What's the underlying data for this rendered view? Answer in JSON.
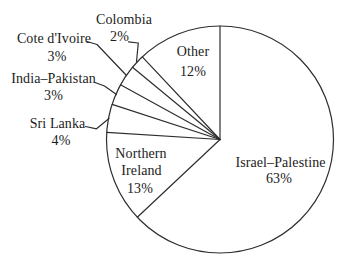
{
  "colors": {
    "background": "#ffffff",
    "line": "#2e2e2e",
    "text": "#1c1c1c"
  },
  "chart_data": {
    "type": "pie",
    "title": "",
    "direction": "clockwise",
    "start_angle_deg": 0,
    "legend": "none",
    "slices": [
      {
        "label": "Israel–Palestine",
        "value": 63,
        "pct_text": "63%",
        "label_position": "inside"
      },
      {
        "label": "Northern Ireland",
        "value": 13,
        "pct_text": "13%",
        "label_position": "inside",
        "label_lines": [
          "Northern",
          "Ireland"
        ]
      },
      {
        "label": "Sri Lanka",
        "value": 4,
        "pct_text": "4%",
        "label_position": "outside-left"
      },
      {
        "label": "India–Pakistan",
        "value": 3,
        "pct_text": "3%",
        "label_position": "outside-left"
      },
      {
        "label": "Cote d'Ivoire",
        "value": 3,
        "pct_text": "3%",
        "label_position": "outside-left"
      },
      {
        "label": "Colombia",
        "value": 2,
        "pct_text": "2%",
        "label_position": "outside-top"
      },
      {
        "label": "Other",
        "value": 12,
        "pct_text": "12%",
        "label_position": "inside"
      }
    ]
  }
}
